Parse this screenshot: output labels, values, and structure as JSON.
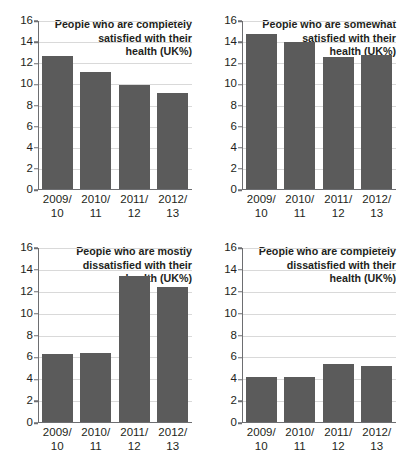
{
  "chart_data": [
    {
      "type": "bar",
      "panel": "top-left",
      "title": "People who are completely satisfied with their health (UK%)",
      "title_lines": [
        "People who are completely",
        "satisfied with their",
        "health (UK%)"
      ],
      "categories": [
        "2009/ 10",
        "2010/ 11",
        "2011/ 12",
        "2012/ 13"
      ],
      "category_lines": [
        [
          "2009/",
          "10"
        ],
        [
          "2010/",
          "11"
        ],
        [
          "2011/",
          "12"
        ],
        [
          "2012/",
          "13"
        ]
      ],
      "values": [
        12.7,
        11.2,
        9.9,
        9.2
      ],
      "xlabel": "",
      "ylabel": "",
      "ylim": [
        0,
        16
      ],
      "yticks": [
        0,
        2,
        4,
        6,
        8,
        10,
        12,
        14,
        16
      ],
      "grid": true,
      "legend": "none",
      "bar_color": "#5b5b5b"
    },
    {
      "type": "bar",
      "panel": "top-right",
      "title": "People who are somewhat satisfied with their health (UK%)",
      "title_lines": [
        "People who are somewhat",
        "satisfied with their",
        "health (UK%)"
      ],
      "categories": [
        "2009/ 10",
        "2010/ 11",
        "2011/ 12",
        "2012/ 13"
      ],
      "category_lines": [
        [
          "2009/",
          "10"
        ],
        [
          "2010/",
          "11"
        ],
        [
          "2011/",
          "12"
        ],
        [
          "2012/",
          "13"
        ]
      ],
      "values": [
        14.75,
        14.0,
        12.6,
        12.8
      ],
      "xlabel": "",
      "ylabel": "",
      "ylim": [
        0,
        16
      ],
      "yticks": [
        0,
        2,
        4,
        6,
        8,
        10,
        12,
        14,
        16
      ],
      "grid": true,
      "legend": "none",
      "bar_color": "#5b5b5b"
    },
    {
      "type": "bar",
      "panel": "bottom-left",
      "title": "People who are mostly dissatisfied with their health (UK%)",
      "title_lines": [
        "People who are mostly",
        "dissatisfied with their",
        "health (UK%)"
      ],
      "categories": [
        "2009/ 10",
        "2010/ 11",
        "2011/ 12",
        "2012/ 13"
      ],
      "category_lines": [
        [
          "2009/",
          "10"
        ],
        [
          "2010/",
          "11"
        ],
        [
          "2011/",
          "12"
        ],
        [
          "2012/",
          "13"
        ]
      ],
      "values": [
        6.3,
        6.4,
        13.4,
        12.4
      ],
      "xlabel": "",
      "ylabel": "",
      "ylim": [
        0,
        16
      ],
      "yticks": [
        0,
        2,
        4,
        6,
        8,
        10,
        12,
        14,
        16
      ],
      "grid": true,
      "legend": "none",
      "bar_color": "#5b5b5b"
    },
    {
      "type": "bar",
      "panel": "bottom-right",
      "title": "People who are completely dissatisfied with their health (UK%)",
      "title_lines": [
        "People who are completely",
        "dissatisfied with their",
        "health (UK%)"
      ],
      "categories": [
        "2009/ 10",
        "2010/ 11",
        "2011/ 12",
        "2012/ 13"
      ],
      "category_lines": [
        [
          "2009/",
          "10"
        ],
        [
          "2010/",
          "11"
        ],
        [
          "2011/",
          "12"
        ],
        [
          "2012/",
          "13"
        ]
      ],
      "values": [
        4.2,
        4.2,
        5.4,
        5.2
      ],
      "xlabel": "",
      "ylabel": "",
      "ylim": [
        0,
        16
      ],
      "yticks": [
        0,
        2,
        4,
        6,
        8,
        10,
        12,
        14,
        16
      ],
      "grid": true,
      "legend": "none",
      "bar_color": "#5b5b5b"
    }
  ]
}
